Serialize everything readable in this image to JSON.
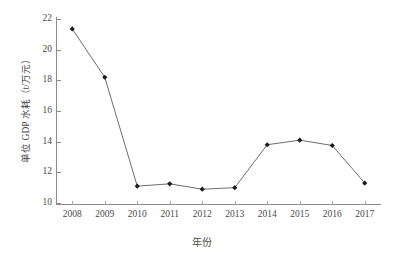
{
  "chart_data": {
    "type": "line",
    "title": "",
    "xlabel": "年份",
    "ylabel": "单位 GDP 水耗（t/万元）",
    "categories": [
      "2008",
      "2009",
      "2010",
      "2011",
      "2012",
      "2013",
      "2014",
      "2015",
      "2016",
      "2017"
    ],
    "values": [
      21.35,
      18.2,
      11.1,
      11.25,
      10.9,
      11.0,
      13.8,
      14.1,
      13.75,
      11.3
    ],
    "series": [
      {
        "name": "单位 GDP 水耗",
        "values": [
          21.35,
          18.2,
          11.1,
          11.25,
          10.9,
          11.0,
          13.8,
          14.1,
          13.75,
          11.3
        ]
      }
    ],
    "ylim": [
      10,
      22
    ],
    "yticks": [
      10,
      12,
      14,
      16,
      18,
      20,
      22
    ],
    "ytick_labels": [
      "10",
      "12",
      "14",
      "16",
      "18",
      "20",
      "22"
    ],
    "xtick_labels": [
      "2008",
      "2009",
      "2010",
      "2011",
      "2012",
      "2013",
      "2014",
      "2015",
      "2016",
      "2017"
    ],
    "grid": false,
    "legend": false,
    "legend_position": "none",
    "marker": "diamond",
    "line_color": "#6e6e6e",
    "marker_color": "#1c1c1c",
    "axis_color": "#8c8c8c",
    "background": "#ffffff"
  }
}
